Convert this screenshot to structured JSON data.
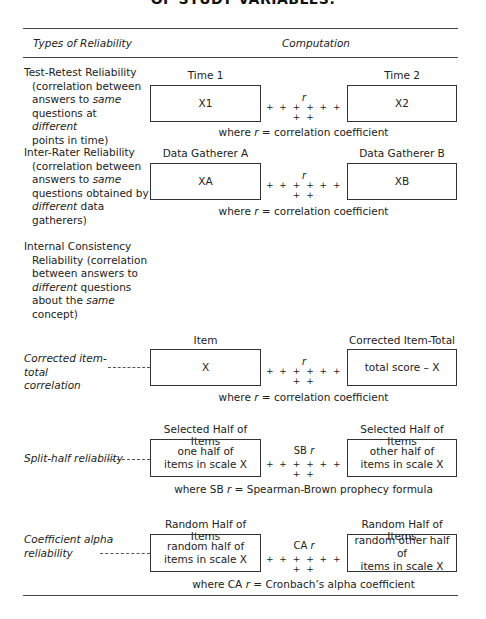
{
  "title": "OF STUDY VARIABLES.",
  "header": {
    "col1": "Types of Reliability",
    "col2": "Computation"
  },
  "rows": {
    "test_retest": {
      "label_main": "Test-Retest Reliability",
      "label_l1": "(correlation between",
      "label_l2a": "answers to ",
      "label_l2b": "same",
      "label_l3a": "questions at ",
      "label_l3b": "different",
      "label_l4": "points in time)",
      "left_head": "Time 1",
      "right_head": "Time 2",
      "left_box": "X1",
      "right_box": "X2",
      "symbol": "r",
      "plus": "+ + + + + + + +",
      "caption_a": "where ",
      "caption_r": "r",
      "caption_b": " = correlation coefficient"
    },
    "inter_rater": {
      "label_main": "Inter-Rater Reliability",
      "label_l1": "(correlation between",
      "label_l2a": "answers to ",
      "label_l2b": "same",
      "label_l3": "questions obtained by",
      "label_l4a": "different",
      "label_l4b": " data",
      "label_l5": "gatherers)",
      "left_head": "Data Gatherer A",
      "right_head": "Data Gatherer B",
      "left_box": "XA",
      "right_box": "XB",
      "symbol": "r",
      "plus": "+ + + + + + + +",
      "caption_a": "where ",
      "caption_r": "r",
      "caption_b": " = correlation coefficient"
    },
    "internal": {
      "label_main": "Internal Consistency",
      "label_l1": "Reliability (correlation",
      "label_l2": "between answers to",
      "label_l3a": "different",
      "label_l3b": " questions",
      "label_l4a": "about the ",
      "label_l4b": "same",
      "label_l5": "concept)"
    },
    "item_total": {
      "label_l1": "Corrected item-total",
      "label_l2": "correlation",
      "left_head": "Item",
      "right_head": "Corrected Item-Total",
      "left_box": "X",
      "right_box": "total score – X",
      "symbol": "r",
      "plus": "+ + + + + + + +",
      "caption_a": "where ",
      "caption_r": "r",
      "caption_b": " = correlation coefficient"
    },
    "split_half": {
      "label": "Split-half reliability",
      "left_head": "Selected Half of Items",
      "right_head": "Selected Half of Items",
      "left_box_l1": "one half of",
      "left_box_l2": "items in scale X",
      "right_box_l1": "other half of",
      "right_box_l2": "items in scale X",
      "symbol_a": "SB ",
      "symbol_r": "r",
      "plus": "+ + + + + + + +",
      "caption_a": "where SB ",
      "caption_r": "r",
      "caption_b": " = Spearman-Brown prophecy formula"
    },
    "alpha": {
      "label_l1": "Coefficient alpha",
      "label_l2": "reliability",
      "left_head": "Random Half of Items",
      "right_head": "Random Half of Items",
      "left_box_l1": "random half of",
      "left_box_l2": "items in scale X",
      "right_box_l1": "random other half of",
      "right_box_l2": "items in scale X",
      "symbol_a": "CA ",
      "symbol_r": "r",
      "plus": "+ + + + + + + +",
      "caption_a": "where CA ",
      "caption_r": "r",
      "caption_b": " = Cronbach’s alpha coefficient"
    }
  }
}
